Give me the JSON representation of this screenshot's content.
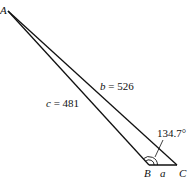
{
  "diagram": {
    "type": "triangle",
    "vertices": {
      "A": {
        "label": "A"
      },
      "B": {
        "label": "B"
      },
      "C": {
        "label": "C"
      }
    },
    "sides": {
      "a": {
        "label": "a",
        "between": [
          "B",
          "C"
        ]
      },
      "b": {
        "label": "b",
        "value": "526",
        "text": "b = 526",
        "between": [
          "A",
          "C"
        ]
      },
      "c": {
        "label": "c",
        "value": "481",
        "text": "c = 481",
        "between": [
          "A",
          "B"
        ]
      }
    },
    "angle_B": {
      "value": "134.7°",
      "at": "B"
    }
  },
  "labels": {
    "vertex_A": "A",
    "vertex_B": "B",
    "vertex_C": "C",
    "side_a": "a",
    "side_b_var": "b",
    "side_b_eq": " = 526",
    "side_c_var": "c",
    "side_c_eq": " = 481",
    "angle_B": "134.7°"
  },
  "colors": {
    "stroke": "#111111",
    "background": "#ffffff"
  }
}
